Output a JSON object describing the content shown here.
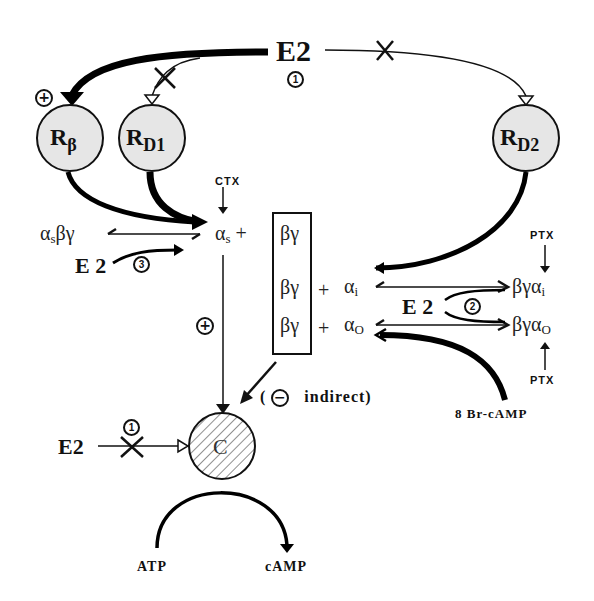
{
  "diagram": {
    "top_ligand": {
      "label": "E2",
      "site_badge": "1"
    },
    "receptors": [
      {
        "id": "rbeta",
        "label": "R",
        "sub": "β",
        "effect": "+"
      },
      {
        "id": "rd1",
        "label": "R",
        "sub": "D1",
        "blocked": true
      },
      {
        "id": "rd2",
        "label": "R",
        "sub": "D2",
        "blocked": true
      }
    ],
    "toxins": {
      "ctx": "CTX",
      "ptx_top": "PTX",
      "ptx_bottom": "PTX"
    },
    "g_proteins": {
      "as_by": {
        "a": "α",
        "a_sub": "s",
        "rest": "βγ"
      },
      "alpha_s": {
        "a": "α",
        "a_sub": "s",
        "plus": "+"
      },
      "bg_box": [
        "βγ",
        "βγ",
        "βγ"
      ],
      "plus_i": "+",
      "plus_o": "+",
      "alpha_i": {
        "a": "α",
        "a_sub": "i"
      },
      "alpha_o": {
        "a": "α",
        "a_sub": "O"
      },
      "bg_alpha_i": {
        "pre": "βγα",
        "sub": "i"
      },
      "bg_alpha_o": {
        "pre": "βγα",
        "sub": "O"
      }
    },
    "e2_site3": {
      "label": "E 2",
      "badge": "3"
    },
    "e2_site2": {
      "label": "E 2",
      "badge": "2"
    },
    "e2_site1_cyclase": {
      "label": "E2",
      "badge": "1"
    },
    "stimulatory_sign": "+",
    "indirect_note": {
      "open": "(",
      "sign": "−",
      "text": "indirect)"
    },
    "cyclase": {
      "label": "C"
    },
    "reaction": {
      "substrate": "ATP",
      "product": "cAMP"
    },
    "analog": "8  Br-cAMP"
  }
}
